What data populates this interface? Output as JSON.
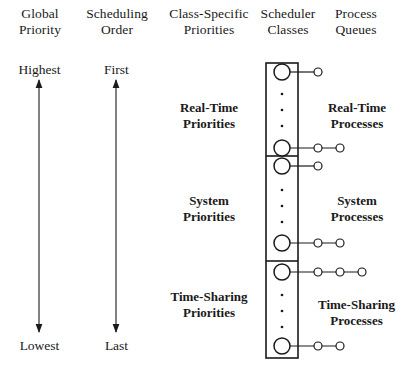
{
  "diagram": {
    "columns": [
      {
        "id": "global-priority",
        "label": "Global\nPriority",
        "cx": 40,
        "y": 6
      },
      {
        "id": "scheduling-order",
        "label": "Scheduling\nOrder",
        "cx": 117,
        "y": 6
      },
      {
        "id": "class-specific-priorities",
        "label": "Class-Specific\nPriorities",
        "cx": 209,
        "y": 6
      },
      {
        "id": "scheduler-classes",
        "label": "Scheduler\nClasses",
        "cx": 288,
        "y": 6
      },
      {
        "id": "process-queues",
        "label": "Process\nQueues",
        "cx": 356,
        "y": 6
      }
    ],
    "axes": [
      {
        "id": "global-priority-axis",
        "top_label": "Highest",
        "bottom_label": "Lowest",
        "cx": 39,
        "top_y": 62,
        "bottom_y": 338
      },
      {
        "id": "scheduling-order-axis",
        "top_label": "First",
        "bottom_label": "Last",
        "cx": 116,
        "top_y": 62,
        "bottom_y": 338
      }
    ],
    "class_priority_labels": [
      {
        "id": "real-time-priorities",
        "label": "Real-Time\nPriorities",
        "cx": 209,
        "cy": 108
      },
      {
        "id": "system-priorities",
        "label": "System\nPriorities",
        "cx": 209,
        "cy": 201
      },
      {
        "id": "time-sharing-priorities",
        "label": "Time-Sharing\nPriorities",
        "cx": 209,
        "cy": 297
      }
    ],
    "scheduler_class_box": {
      "x": 266,
      "y": 63,
      "width": 32,
      "height": 295,
      "dividers_y": [
        156,
        261
      ],
      "sections": [
        {
          "id": "real-time-class",
          "top": 63,
          "bottom": 156
        },
        {
          "id": "system-class",
          "top": 156,
          "bottom": 261
        },
        {
          "id": "time-sharing-class",
          "top": 261,
          "bottom": 358
        }
      ]
    },
    "queue_rows": [
      {
        "id": "real-time-queue-top",
        "class": "real-time",
        "cy": 72,
        "node_count": 1
      },
      {
        "id": "real-time-queue-bottom",
        "class": "real-time",
        "cy": 148,
        "node_count": 2
      },
      {
        "id": "system-queue-top",
        "class": "system",
        "cy": 166,
        "node_count": 1
      },
      {
        "id": "system-queue-bottom",
        "class": "system",
        "cy": 243,
        "node_count": 2
      },
      {
        "id": "time-sharing-queue-top",
        "class": "time-sharing",
        "cy": 272,
        "node_count": 3
      },
      {
        "id": "time-sharing-queue-bottom",
        "class": "time-sharing",
        "cy": 346,
        "node_count": 2
      }
    ],
    "ellipsis_groups": [
      {
        "id": "real-time-ellipsis",
        "cx": 282,
        "ys": [
          94,
          110,
          126
        ]
      },
      {
        "id": "system-ellipsis",
        "cx": 282,
        "ys": [
          190,
          206,
          222
        ]
      },
      {
        "id": "time-sharing-ellipsis",
        "cx": 282,
        "ys": [
          295,
          311,
          327
        ]
      }
    ],
    "queue_labels": [
      {
        "id": "real-time-processes",
        "label": "Real-Time\nProcesses",
        "cx": 356,
        "cy": 108
      },
      {
        "id": "system-processes",
        "label": "System\nProcesses",
        "cx": 356,
        "cy": 201
      },
      {
        "id": "time-sharing-processes",
        "label": "Time-Sharing\nProcesses",
        "cx": 356,
        "cy": 305
      }
    ],
    "geometry": {
      "class_circle_cx": 282,
      "class_circle_r": 8,
      "queue_node_r": 4,
      "queue_node_xs": [
        318,
        340,
        362
      ],
      "connector_start_x": 290
    },
    "colors": {
      "background": "#ffffff",
      "stroke": "#1a1a1a",
      "text": "#1a1a1a",
      "node_fill": "#ffffff"
    }
  }
}
